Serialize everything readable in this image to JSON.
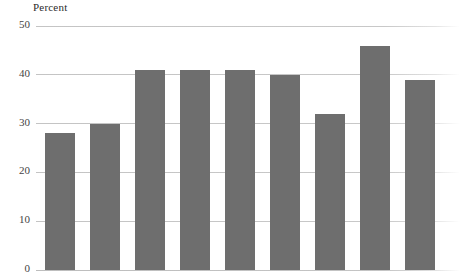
{
  "chart_data": {
    "type": "bar",
    "title": "",
    "ylabel": "Percent",
    "xlabel": "",
    "ylim": [
      0,
      50
    ],
    "yticks": [
      0,
      10,
      20,
      30,
      40,
      50
    ],
    "ytick_labels": [
      "0",
      "10",
      "20",
      "30",
      "40",
      "50"
    ],
    "grid": true,
    "legend": "none",
    "categories": [
      "1",
      "2",
      "3",
      "4",
      "5",
      "6",
      "7",
      "8",
      "9"
    ],
    "values": [
      28,
      30,
      41,
      41,
      41,
      40,
      32,
      46,
      39
    ],
    "series": [
      {
        "name": "Percent",
        "values": [
          28,
          30,
          41,
          41,
          41,
          40,
          32,
          46,
          39
        ]
      }
    ],
    "bar_color": "#6e6e6e",
    "gridline_color": "#c8c8c8",
    "text_color": "#2b2b2b",
    "background_color": "#ffffff",
    "note": "x-axis category labels are cropped out of the visible image"
  },
  "axis": {
    "y_title": "Percent"
  }
}
